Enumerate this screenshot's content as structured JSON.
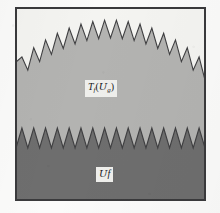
{
  "figure": {
    "kind": "sawtooth-region-diagram",
    "frame": {
      "x": 15,
      "y": 7,
      "width": 191,
      "height": 194,
      "border_color": "#3a3a3c",
      "border_width": 2,
      "interior_color": "#f4f4f1"
    },
    "page_background": "#fbfbfa",
    "upper_region": {
      "name": "T_f(U_g)",
      "fill_color": "#b3b3b1",
      "outline_color": "#3f3f41",
      "tooth_count": 16,
      "envelope": "dome",
      "peak_y_center": 20,
      "peak_y_edge": 62,
      "valley_offset": 18,
      "baseline_y": 201
    },
    "lower_region": {
      "name": "U_f",
      "fill_color": "#6e6e6e",
      "outline_color": "#3f3f41",
      "tooth_count": 16,
      "envelope": "flat",
      "peak_y": 128,
      "valley_y": 148,
      "baseline_y": 201
    },
    "labels": {
      "upper": {
        "text": "T_f(U_g)",
        "main_symbol": "T",
        "main_subscript": "f",
        "open_paren": "(",
        "script_symbol": "U",
        "script_subscript": "g",
        "close_paren": ")",
        "box_fill": "#efefec",
        "text_color": "#18181a"
      },
      "lower": {
        "text": "U_f",
        "script_symbol": "U",
        "main_symbol": "f",
        "box_fill": "#efefec",
        "text_color": "#18181a"
      }
    }
  }
}
